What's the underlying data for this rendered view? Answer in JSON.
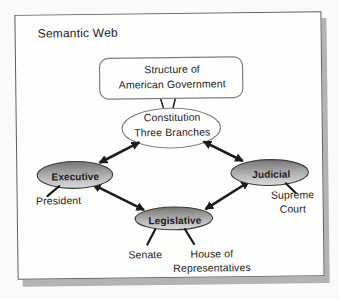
{
  "colors": {
    "page-bg": "#fafaf8",
    "panel-bg": "#fdfdfc",
    "panel-border": "#5f5f5f",
    "panel-shadow": "#b3b3b3",
    "node-gradient-top": "#747474",
    "node-gradient-mid": "#b2b2b2",
    "node-gradient-bottom": "#dcdcdc",
    "node-border": "#3a3a3a",
    "white-node-border": "#7e7e7e",
    "line-color": "#1c1c1c",
    "text-color": "#232323"
  },
  "panel": {
    "title": "Semantic Web"
  },
  "diagram": {
    "root": {
      "line1": "Structure of",
      "line2": "American Government"
    },
    "hub": {
      "line1": "Constitution",
      "line2": "Three Branches"
    },
    "branches": [
      {
        "label": "Executive"
      },
      {
        "label": "Judicial"
      },
      {
        "label": "Legislative"
      }
    ],
    "leaves": {
      "president": "President",
      "supreme_line1": "Supreme",
      "supreme_line2": "Court",
      "senate": "Senate",
      "house_line1": "House of",
      "house_line2": "Representatives"
    }
  }
}
